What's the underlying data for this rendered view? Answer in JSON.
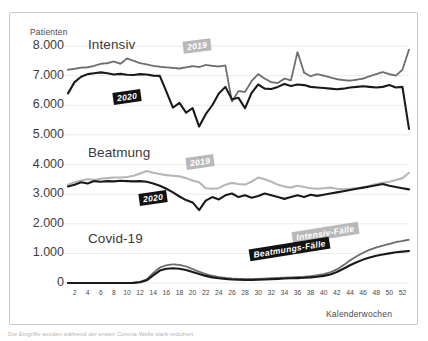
{
  "axes": {
    "y_title": "Patienten",
    "x_title": "Kalenderwochen",
    "y_ticks": [
      "8.000",
      "7.000",
      "6.000",
      "5.000",
      "4.000",
      "3.000",
      "2.000",
      "1.000",
      "0"
    ],
    "x_ticks": [
      "2",
      "4",
      "6",
      "8",
      "10",
      "12",
      "14",
      "16",
      "18",
      "20",
      "22",
      "24",
      "26",
      "28",
      "30",
      "32",
      "34",
      "36",
      "38",
      "40",
      "42",
      "44",
      "46",
      "48",
      "50",
      "52"
    ]
  },
  "group_labels": {
    "intensiv": "Intensiv",
    "beatmung": "Beatmung",
    "covid": "Covid-19"
  },
  "tags": {
    "intensiv_2019": "2019",
    "intensiv_2020": "2020",
    "beatmung_2019": "2019",
    "beatmung_2020": "2020",
    "covid_intensiv": "Intensiv-Fälle",
    "covid_beatmung": "Beatmungs-Fälle"
  },
  "colors": {
    "series_2020": "#1a1a1a",
    "series_2019": "#b0b0b0",
    "grid": "#ebebeb",
    "frame": "#c9c9c9",
    "tick_text": "#3d3d3d"
  },
  "caption": "Die Eingriffe wurden während der ersten Corona-Welle stark reduziert",
  "chart_data": {
    "type": "line",
    "title": "",
    "xlabel": "Kalenderwochen",
    "ylabel": "Patienten",
    "ylim": [
      0,
      8400
    ],
    "xlim": [
      1,
      53
    ],
    "grid": true,
    "legend_position": "inline-annotations",
    "x": [
      1,
      2,
      3,
      4,
      5,
      6,
      7,
      8,
      9,
      10,
      11,
      12,
      13,
      14,
      15,
      16,
      17,
      18,
      19,
      20,
      21,
      22,
      23,
      24,
      25,
      26,
      27,
      28,
      29,
      30,
      31,
      32,
      33,
      34,
      35,
      36,
      37,
      38,
      39,
      40,
      41,
      42,
      43,
      44,
      45,
      46,
      47,
      48,
      49,
      50,
      51,
      52,
      53
    ],
    "series": [
      {
        "name": "Intensiv 2019",
        "style": "dotted",
        "color": "#6d6d6d",
        "values": [
          7200,
          7230,
          7270,
          7280,
          7330,
          7400,
          7420,
          7480,
          7400,
          7580,
          7500,
          7420,
          7380,
          7330,
          7300,
          7280,
          7260,
          7240,
          7280,
          7320,
          7290,
          7360,
          7330,
          7310,
          7340,
          6120,
          6480,
          6450,
          6820,
          7050,
          6900,
          6780,
          6750,
          6900,
          6840,
          7800,
          7100,
          6980,
          7050,
          7000,
          6940,
          6880,
          6850,
          6830,
          6860,
          6900,
          6980,
          7050,
          7120,
          7050,
          7000,
          7200,
          7880
        ]
      },
      {
        "name": "Intensiv 2020",
        "style": "solid",
        "color": "#1a1a1a",
        "values": [
          6400,
          6780,
          6960,
          7050,
          7080,
          7110,
          7080,
          7040,
          7060,
          7030,
          7020,
          7050,
          7040,
          7000,
          6990,
          6460,
          5920,
          6080,
          5750,
          5900,
          5280,
          5700,
          6000,
          6400,
          6620,
          6200,
          6250,
          5900,
          6420,
          6700,
          6560,
          6550,
          6620,
          6720,
          6650,
          6700,
          6680,
          6620,
          6600,
          6580,
          6560,
          6540,
          6560,
          6600,
          6620,
          6640,
          6620,
          6600,
          6620,
          6680,
          6600,
          6620,
          5200
        ]
      },
      {
        "name": "Beatmung 2019",
        "style": "solid",
        "color": "#b6b6b6",
        "values": [
          3320,
          3400,
          3460,
          3500,
          3480,
          3520,
          3540,
          3560,
          3560,
          3580,
          3620,
          3700,
          3780,
          3720,
          3680,
          3640,
          3620,
          3600,
          3540,
          3460,
          3400,
          3200,
          3180,
          3200,
          3320,
          3380,
          3340,
          3320,
          3420,
          3560,
          3500,
          3420,
          3320,
          3260,
          3220,
          3280,
          3240,
          3200,
          3180,
          3200,
          3220,
          3180,
          3160,
          3180,
          3200,
          3220,
          3280,
          3340,
          3380,
          3420,
          3480,
          3540,
          3720
        ]
      },
      {
        "name": "Beatmung 2020",
        "style": "solid",
        "color": "#1a1a1a",
        "values": [
          3260,
          3320,
          3400,
          3360,
          3440,
          3420,
          3440,
          3430,
          3450,
          3440,
          3430,
          3440,
          3420,
          3360,
          3280,
          3180,
          3060,
          2920,
          2800,
          2720,
          2460,
          2780,
          2900,
          2820,
          2960,
          3020,
          2900,
          2960,
          2880,
          2940,
          3020,
          2960,
          2900,
          2840,
          2900,
          2960,
          2900,
          2980,
          2940,
          2980,
          3020,
          3060,
          3100,
          3140,
          3180,
          3220,
          3260,
          3300,
          3340,
          3280,
          3240,
          3200,
          3160
        ]
      },
      {
        "name": "Covid-19 Intensiv-Fälle",
        "style": "dotted",
        "color": "#6d6d6d",
        "values": [
          0,
          0,
          0,
          0,
          0,
          0,
          0,
          0,
          0,
          0,
          10,
          40,
          120,
          340,
          520,
          600,
          630,
          610,
          560,
          470,
          380,
          300,
          240,
          200,
          170,
          150,
          140,
          130,
          130,
          140,
          150,
          160,
          170,
          180,
          190,
          200,
          210,
          230,
          260,
          300,
          360,
          460,
          600,
          760,
          900,
          1020,
          1120,
          1200,
          1260,
          1320,
          1380,
          1420,
          1460
        ]
      },
      {
        "name": "Covid-19 Beatmungs-Fälle",
        "style": "solid",
        "color": "#1a1a1a",
        "values": [
          0,
          0,
          0,
          0,
          0,
          0,
          0,
          0,
          0,
          0,
          5,
          25,
          90,
          260,
          420,
          480,
          500,
          480,
          440,
          370,
          300,
          240,
          190,
          160,
          140,
          120,
          110,
          105,
          105,
          110,
          120,
          130,
          140,
          150,
          160,
          165,
          175,
          190,
          210,
          240,
          290,
          370,
          480,
          600,
          700,
          790,
          860,
          920,
          960,
          1000,
          1040,
          1060,
          1080
        ]
      }
    ]
  }
}
